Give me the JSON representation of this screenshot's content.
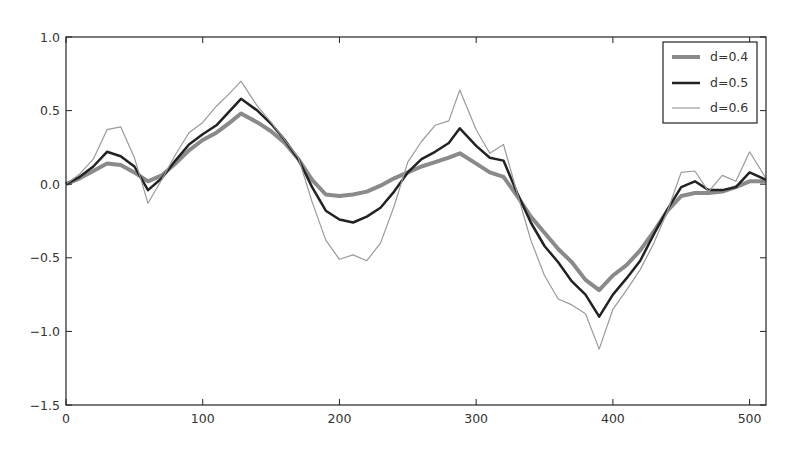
{
  "chart_data": {
    "type": "line",
    "title": "",
    "xlabel": "",
    "ylabel": "",
    "xlim": [
      0,
      512
    ],
    "ylim": [
      -1.5,
      1.0
    ],
    "grid": false,
    "legend_position": "upper right",
    "x_ticks": [
      0,
      100,
      200,
      300,
      400,
      500
    ],
    "x_tick_labels": [
      "0",
      "100",
      "200",
      "300",
      "400",
      "500"
    ],
    "y_ticks": [
      1.0,
      0.5,
      0.0,
      -0.5,
      -1.0,
      -1.5
    ],
    "y_tick_labels": [
      "1.0",
      "0.5",
      "0.0",
      "−0.5",
      "−1.0",
      "−1.5"
    ],
    "x": [
      0,
      10,
      20,
      30,
      40,
      50,
      60,
      70,
      80,
      90,
      100,
      110,
      120,
      128,
      140,
      150,
      160,
      170,
      180,
      190,
      200,
      210,
      220,
      230,
      240,
      250,
      260,
      270,
      280,
      288,
      300,
      310,
      320,
      330,
      340,
      350,
      360,
      370,
      380,
      390,
      400,
      410,
      420,
      430,
      440,
      450,
      460,
      470,
      480,
      490,
      500,
      512
    ],
    "series": [
      {
        "name": "d=0.4",
        "color": "#8a8a8a",
        "width": 4,
        "values": [
          0.0,
          0.04,
          0.09,
          0.14,
          0.13,
          0.08,
          0.02,
          0.06,
          0.14,
          0.23,
          0.3,
          0.35,
          0.42,
          0.48,
          0.42,
          0.36,
          0.28,
          0.17,
          0.03,
          -0.07,
          -0.08,
          -0.07,
          -0.05,
          -0.01,
          0.04,
          0.08,
          0.12,
          0.15,
          0.18,
          0.21,
          0.14,
          0.08,
          0.05,
          -0.08,
          -0.22,
          -0.33,
          -0.44,
          -0.53,
          -0.65,
          -0.72,
          -0.62,
          -0.55,
          -0.45,
          -0.32,
          -0.18,
          -0.08,
          -0.06,
          -0.06,
          -0.05,
          -0.02,
          0.02,
          0.02
        ]
      },
      {
        "name": "d=0.5",
        "color": "#222222",
        "width": 2.5,
        "values": [
          0.0,
          0.05,
          0.12,
          0.22,
          0.19,
          0.12,
          -0.04,
          0.04,
          0.16,
          0.27,
          0.34,
          0.4,
          0.5,
          0.58,
          0.5,
          0.41,
          0.3,
          0.17,
          -0.02,
          -0.18,
          -0.24,
          -0.26,
          -0.22,
          -0.16,
          -0.05,
          0.08,
          0.17,
          0.22,
          0.28,
          0.38,
          0.26,
          0.18,
          0.16,
          -0.06,
          -0.26,
          -0.42,
          -0.53,
          -0.66,
          -0.75,
          -0.9,
          -0.75,
          -0.64,
          -0.52,
          -0.34,
          -0.17,
          -0.02,
          0.02,
          -0.04,
          -0.04,
          -0.02,
          0.08,
          0.03
        ]
      },
      {
        "name": "d=0.6",
        "color": "#9a9a9a",
        "width": 1.2,
        "values": [
          0.0,
          0.07,
          0.17,
          0.37,
          0.39,
          0.18,
          -0.13,
          0.03,
          0.2,
          0.35,
          0.42,
          0.53,
          0.62,
          0.7,
          0.53,
          0.42,
          0.3,
          0.18,
          -0.12,
          -0.38,
          -0.51,
          -0.48,
          -0.52,
          -0.4,
          -0.15,
          0.15,
          0.29,
          0.4,
          0.43,
          0.64,
          0.37,
          0.21,
          0.27,
          -0.06,
          -0.38,
          -0.62,
          -0.78,
          -0.82,
          -0.88,
          -1.12,
          -0.85,
          -0.72,
          -0.58,
          -0.4,
          -0.18,
          0.08,
          0.09,
          -0.05,
          0.06,
          0.02,
          0.22,
          0.04
        ]
      }
    ]
  }
}
